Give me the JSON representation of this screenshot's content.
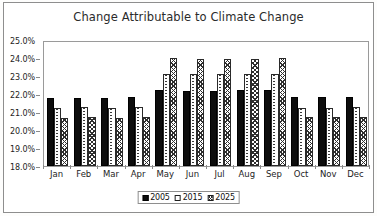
{
  "chart_data": {
    "type": "bar",
    "title": "Change Attributable to Climate Change",
    "xlabel": "",
    "ylabel": "",
    "ylim": [
      18.0,
      25.0
    ],
    "ytick_step": 1.0,
    "ytick_labels": [
      "25.0%",
      "24.0%",
      "23.0%",
      "22.0%",
      "21.0%",
      "20.0%",
      "19.0%",
      "18.0%"
    ],
    "ytick_values": [
      25.0,
      24.0,
      23.0,
      22.0,
      21.0,
      20.0,
      19.0,
      18.0
    ],
    "grid": false,
    "legend_position": "bottom",
    "categories": [
      "Jan",
      "Feb",
      "Mar",
      "Apr",
      "May",
      "Jun",
      "Jul",
      "Aug",
      "Sep",
      "Oct",
      "Nov",
      "Dec"
    ],
    "series": [
      {
        "name": "2005",
        "pattern": "solid-black",
        "values": [
          21.8,
          21.8,
          21.8,
          21.85,
          22.2,
          22.15,
          22.15,
          22.2,
          22.2,
          21.85,
          21.85,
          21.85
        ]
      },
      {
        "name": "2015",
        "pattern": "dotted-white",
        "values": [
          21.25,
          21.3,
          21.25,
          21.3,
          23.1,
          23.1,
          23.1,
          23.1,
          23.1,
          21.25,
          21.25,
          21.3
        ]
      },
      {
        "name": "2025",
        "pattern": "cross-hatch",
        "values": [
          20.65,
          20.7,
          20.65,
          20.7,
          24.0,
          23.95,
          23.95,
          23.95,
          24.0,
          20.7,
          20.7,
          20.7
        ]
      }
    ]
  },
  "legend": {
    "items": [
      {
        "label": "2005"
      },
      {
        "label": "2015"
      },
      {
        "label": "2025"
      }
    ]
  },
  "colors": {
    "series_2005": "#0d0d0d",
    "series_2015": "#ffffff",
    "series_2025": "#ffffff",
    "axis": "#9a9a9a",
    "border": "#8e8e8e",
    "text": "#1d1d1d",
    "plot_background": "#ffffff"
  }
}
